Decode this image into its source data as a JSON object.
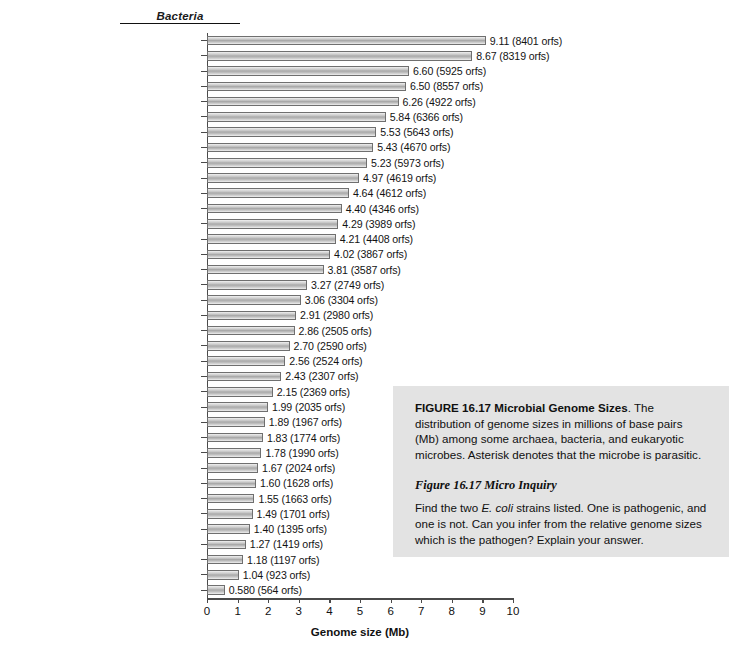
{
  "chart_data": {
    "type": "bar",
    "orientation": "horizontal",
    "title": "",
    "group_heading": "Bacteria",
    "xlabel": "Genome size (Mb)",
    "ylabel": "",
    "xlim": [
      0,
      10
    ],
    "xticks": [
      "0",
      "1",
      "2",
      "3",
      "4",
      "5",
      "6",
      "7",
      "8",
      "9",
      "10"
    ],
    "grid": false,
    "legend": "none",
    "unit_note": "Values in Mb; parenthetical counts are open reading frames (orfs)",
    "categories": [
      "Bradyrhizobium japonicum",
      "Streptomyces coelicolor",
      "Pseudomonas aeruginosa",
      "Acaryochloris marina",
      "Bacteroides thetaiotaomicron",
      "Microcystis aeruginosa",
      "Escherichia coli 0157:H7",
      "Frankia sp.",
      "Bacillus anthracis",
      "Magnetospirillum magneticum",
      "Escherichia coli K12",
      "Mycobacterium tuberculosis",
      "Clostridium difficile",
      "Bacillus subtilis",
      "Caulobacter crescentus",
      "Geobacter sulfurreducens",
      "Mycobacterium leprae",
      "Deinococcus radiodurans",
      "Staphylococcus aureus",
      "Flavobacterium psychrophilum",
      "Synechococcus elongatus",
      "Sulfurovum sp.",
      "Thiomicrospira crunogena",
      "Chlorobium tepidum",
      "Lactobacillus acidophilus",
      "Francisella tularensis",
      "Haemophilus influenzae",
      "Campylobacter jejuni",
      "Prochlorococcus marinus",
      "Helicobacter pylori",
      "Aquifex aeolicus",
      "Borrelia burgdorferi",
      "Dichelobacter nodosus",
      "*Rickettsia conorii",
      "*Ehrlichia chaffeensis",
      "*Chlamydia trachomatis",
      "*Mycoplasma genitalium"
    ],
    "values": [
      9.11,
      8.67,
      6.6,
      6.5,
      6.26,
      5.84,
      5.53,
      5.43,
      5.23,
      4.97,
      4.64,
      4.4,
      4.29,
      4.21,
      4.02,
      3.81,
      3.27,
      3.06,
      2.91,
      2.86,
      2.7,
      2.56,
      2.43,
      2.15,
      1.99,
      1.89,
      1.83,
      1.78,
      1.67,
      1.6,
      1.55,
      1.49,
      1.4,
      1.27,
      1.18,
      1.04,
      0.58
    ],
    "orfs": [
      8401,
      8319,
      5925,
      8557,
      4922,
      6366,
      5643,
      4670,
      5973,
      4619,
      4612,
      4346,
      3989,
      4408,
      3867,
      3587,
      2749,
      3304,
      2980,
      2505,
      2590,
      2524,
      2307,
      2369,
      2035,
      1967,
      1774,
      1990,
      2024,
      1628,
      1663,
      1701,
      1395,
      1419,
      1197,
      923,
      564
    ],
    "data_labels": [
      "9.11 (8401 orfs)",
      "8.67 (8319 orfs)",
      "6.60 (5925 orfs)",
      "6.50 (8557 orfs)",
      "6.26 (4922 orfs)",
      "5.84 (6366 orfs)",
      "5.53 (5643 orfs)",
      "5.43 (4670 orfs)",
      "5.23 (5973 orfs)",
      "4.97 (4619 orfs)",
      "4.64 (4612 orfs)",
      "4.40 (4346 orfs)",
      "4.29 (3989 orfs)",
      "4.21 (4408 orfs)",
      "4.02 (3867 orfs)",
      "3.81 (3587 orfs)",
      "3.27 (2749 orfs)",
      "3.06 (3304 orfs)",
      "2.91 (2980 orfs)",
      "2.86 (2505 orfs)",
      "2.70 (2590 orfs)",
      "2.56 (2524 orfs)",
      "2.43 (2307 orfs)",
      "2.15 (2369 orfs)",
      "1.99 (2035 orfs)",
      "1.89 (1967 orfs)",
      "1.83 (1774 orfs)",
      "1.78 (1990 orfs)",
      "1.67 (2024 orfs)",
      "1.60 (1628 orfs)",
      "1.55 (1663 orfs)",
      "1.49 (1701 orfs)",
      "1.40 (1395 orfs)",
      "1.27 (1419 orfs)",
      "1.18 (1197 orfs)",
      "1.04 (923 orfs)",
      "0.580 (564 orfs)"
    ]
  },
  "caption": {
    "figure_number": "FIGURE 16.17",
    "figure_title": "Microbial Genome Sizes",
    "body": ". The distribution of genome sizes in millions of base pairs (Mb) among some archaea, bacteria, and eukaryotic microbes. Asterisk denotes that the microbe is parasitic.",
    "inquiry_heading": "Figure 16.17 Micro Inquiry",
    "inquiry_before": "Find the two ",
    "inquiry_species": "E. coli",
    "inquiry_after": " strains listed. One is pathogenic, and one is not. Can you infer from the relative genome sizes which is the pathogen? Explain your answer."
  },
  "colors": {
    "panel_background": "#e3e3e3",
    "bar_fill_mid": "#a9a9a9",
    "bar_outline": "#6f6f6f",
    "axis": "#4a4a4a",
    "text": "#101010",
    "page_background": "#ffffff"
  }
}
